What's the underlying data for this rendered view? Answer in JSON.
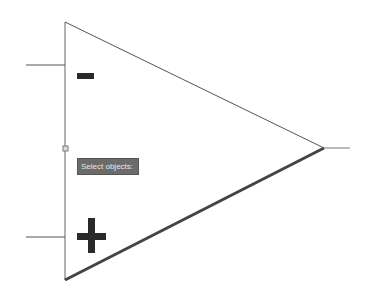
{
  "diagram": {
    "shape": "triangle",
    "colors": {
      "line": "#555555",
      "thick_edge": "#444444",
      "symbol": "#2a2a2a",
      "tooltip_bg": "#6b6b6b",
      "tooltip_text": "#e8e8e8",
      "background": "#ffffff"
    },
    "inputs": [
      {
        "name": "inverting",
        "symbol": "−"
      },
      {
        "name": "non-inverting",
        "symbol": "+"
      }
    ],
    "output": {
      "name": "output"
    }
  },
  "tooltip": {
    "text": "Select objects:"
  }
}
